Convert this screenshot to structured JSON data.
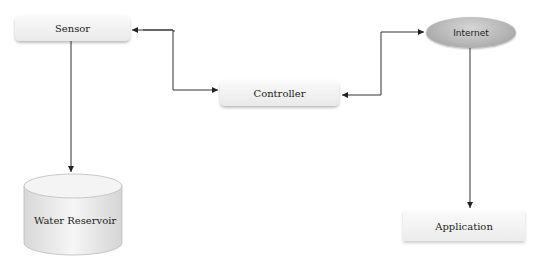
{
  "diagram": {
    "nodes": {
      "sensor": {
        "label": "Sensor",
        "shape": "rounded-rect"
      },
      "controller": {
        "label": "Controller",
        "shape": "rounded-rect"
      },
      "internet": {
        "label": "Internet",
        "shape": "ellipse"
      },
      "water_reservoir": {
        "label": "Water Reservoir",
        "shape": "cylinder"
      },
      "application": {
        "label": "Application",
        "shape": "rect"
      }
    },
    "edges": [
      {
        "from": "sensor",
        "to": "controller",
        "direction": "bidirectional"
      },
      {
        "from": "controller",
        "to": "internet",
        "direction": "bidirectional"
      },
      {
        "from": "sensor",
        "to": "water_reservoir",
        "direction": "forward"
      },
      {
        "from": "internet",
        "to": "application",
        "direction": "forward"
      }
    ],
    "colors": {
      "line": "#333333",
      "node_fill": "#f2f2f2",
      "ellipse_fill": "#b0b0b0"
    }
  }
}
